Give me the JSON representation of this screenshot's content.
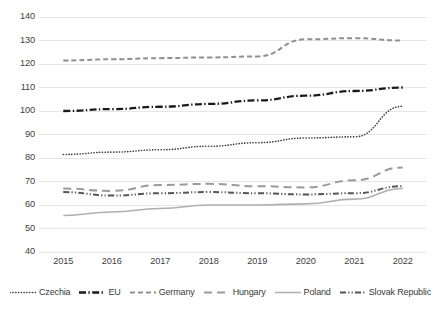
{
  "chart_data": {
    "type": "line",
    "title": "",
    "subtitle": "",
    "xlabel": "",
    "ylabel": "",
    "x": [
      "2015",
      "2016",
      "2017",
      "2018",
      "2019",
      "2020",
      "2021",
      "2022"
    ],
    "categories": [
      "2015",
      "2016",
      "2017",
      "2018",
      "2019",
      "2020",
      "2021",
      "2022"
    ],
    "xlim": [
      2015,
      2022
    ],
    "ylim": [
      40,
      140
    ],
    "yticks": [
      40,
      50,
      60,
      70,
      80,
      90,
      100,
      110,
      120,
      130,
      140
    ],
    "ytick_labels": [
      "40",
      "50",
      "60",
      "70",
      "80",
      "90",
      "100",
      "110",
      "120",
      "130",
      "140"
    ],
    "grid": "horizontal",
    "legend_position": "bottom",
    "series": [
      {
        "name": "Czechia",
        "style": "dotted",
        "color": "#3f3f3f",
        "width": 1.6,
        "values": [
          81.5,
          82.5,
          83.5,
          85.0,
          86.5,
          88.5,
          89.0,
          102.0
        ]
      },
      {
        "name": "EU",
        "style": "dash-dot",
        "color": "#1a1a1a",
        "width": 2.3,
        "values": [
          100.0,
          100.8,
          101.8,
          103.0,
          104.5,
          106.5,
          108.5,
          110.0
        ]
      },
      {
        "name": "Germany",
        "style": "dashed",
        "color": "#8f8f8f",
        "width": 2.0,
        "values": [
          121.5,
          122.0,
          122.5,
          122.8,
          123.2,
          130.5,
          131.0,
          130.0
        ]
      },
      {
        "name": "Hungary",
        "style": "long-dash",
        "color": "#9a9a9a",
        "width": 2.0,
        "values": [
          67.0,
          66.0,
          68.5,
          69.0,
          68.0,
          67.5,
          70.5,
          76.0
        ]
      },
      {
        "name": "Poland",
        "style": "solid",
        "color": "#b0b0b0",
        "width": 1.6,
        "values": [
          55.5,
          57.0,
          58.5,
          60.0,
          60.0,
          60.5,
          62.5,
          67.0
        ]
      },
      {
        "name": "Slovak Republic",
        "style": "dash-dot-dark",
        "color": "#555555",
        "width": 2.0,
        "values": [
          65.5,
          64.0,
          65.0,
          65.5,
          65.0,
          64.5,
          65.0,
          68.0
        ]
      }
    ]
  },
  "axes": {
    "y_ticks": [
      "140",
      "130",
      "120",
      "110",
      "100",
      "90",
      "80",
      "70",
      "60",
      "50",
      "40"
    ],
    "x_ticks": [
      "2015",
      "2016",
      "2017",
      "2018",
      "2019",
      "2020",
      "2021",
      "2022"
    ]
  },
  "legend": {
    "items": [
      {
        "label": "Czechia"
      },
      {
        "label": "EU"
      },
      {
        "label": "Germany"
      },
      {
        "label": "Hungary"
      },
      {
        "label": "Poland"
      },
      {
        "label": "Slovak Republic"
      }
    ]
  },
  "colors": {
    "gridline": "#e6e6e6",
    "axis_text": "#404040",
    "background": "#ffffff"
  }
}
